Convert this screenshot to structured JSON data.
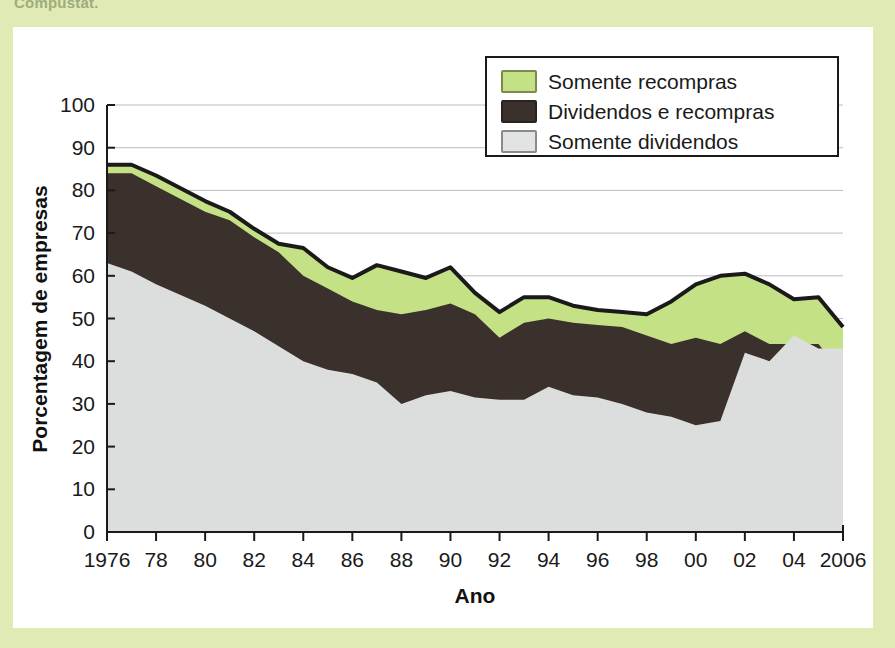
{
  "page": {
    "caption_fragment": "Compustat.",
    "background_color": "#dfeab4",
    "panel_color": "#ffffff"
  },
  "chart_data": {
    "type": "area",
    "stacked": true,
    "title": "",
    "xlabel": "Ano",
    "ylabel": "Porcentagem de empresas",
    "xlim": [
      1976,
      2006
    ],
    "ylim": [
      0,
      100
    ],
    "ytick_step": 10,
    "xtick_step": 2,
    "grid": "horizontal",
    "legend_position": "top-right",
    "y_ticks": [
      "0",
      "10",
      "20",
      "30",
      "40",
      "50",
      "60",
      "70",
      "80",
      "90",
      "100"
    ],
    "x_ticks": [
      "1976",
      "78",
      "80",
      "82",
      "84",
      "86",
      "88",
      "90",
      "92",
      "94",
      "96",
      "98",
      "00",
      "02",
      "04",
      "2006"
    ],
    "x": [
      1976,
      1977,
      1978,
      1979,
      1980,
      1981,
      1982,
      1983,
      1984,
      1985,
      1986,
      1987,
      1988,
      1989,
      1990,
      1991,
      1992,
      1993,
      1994,
      1995,
      1996,
      1997,
      1998,
      1999,
      2000,
      2001,
      2002,
      2003,
      2004,
      2005,
      2006
    ],
    "series": [
      {
        "name": "Somente dividendos",
        "color": "#dcdedd",
        "order": 1,
        "values": [
          63.0,
          61.0,
          58.0,
          55.5,
          53.0,
          50.0,
          47.0,
          43.5,
          40.0,
          38.0,
          37.0,
          35.0,
          30.0,
          32.0,
          33.0,
          31.5,
          31.0,
          31.0,
          34.0,
          32.0,
          31.5,
          30.0,
          28.0,
          27.0,
          25.0,
          26.0,
          42.0,
          40.0,
          46.0,
          43.0,
          43.0
        ]
      },
      {
        "name": "Dividendos e recompras",
        "color": "#3a302c",
        "order": 2,
        "values": [
          21.0,
          23.0,
          23.0,
          22.5,
          22.0,
          23.0,
          22.0,
          22.0,
          20.0,
          19.0,
          17.0,
          17.0,
          21.0,
          20.0,
          20.5,
          19.5,
          14.5,
          18.0,
          16.0,
          17.0,
          17.0,
          18.0,
          18.0,
          17.0,
          20.5,
          18.0,
          5.0,
          4.0,
          -2.0,
          1.0,
          -6.0
        ]
      },
      {
        "name": "Somente recompras",
        "color": "#c5e186",
        "order": 3,
        "values": [
          2.0,
          2.0,
          2.5,
          2.5,
          2.5,
          2.0,
          2.0,
          2.0,
          6.5,
          5.0,
          5.5,
          10.5,
          10.0,
          7.5,
          8.5,
          5.0,
          6.0,
          6.0,
          5.0,
          4.0,
          3.5,
          3.5,
          5.0,
          10.0,
          12.5,
          16.0,
          13.5,
          14.0,
          10.5,
          11.0,
          11.0
        ]
      }
    ],
    "cumulative_top": {
      "dividends_only": [
        63,
        61,
        58,
        55.5,
        53,
        50,
        47,
        43.5,
        40,
        38,
        37,
        35,
        30,
        32,
        33,
        31.5,
        31,
        31,
        34,
        32,
        31.5,
        30,
        28,
        27,
        25,
        26,
        42,
        40,
        46,
        43,
        43
      ],
      "div_plus_repurch": [
        84,
        84,
        81,
        78,
        75,
        73,
        69,
        65.5,
        60,
        57,
        54,
        52,
        51,
        52,
        53.5,
        51,
        45.5,
        49,
        50,
        49,
        48.5,
        48,
        46,
        44,
        45.5,
        44,
        47,
        44,
        44,
        44,
        37
      ],
      "total": [
        86,
        86,
        83.5,
        80.5,
        77.5,
        75,
        71,
        67.5,
        66.5,
        62,
        59.5,
        62.5,
        61,
        59.5,
        62,
        56,
        51.5,
        55,
        55,
        53,
        52,
        51.5,
        51,
        54,
        58,
        60,
        60.5,
        58,
        54.5,
        55,
        48
      ]
    },
    "legend": [
      {
        "label": "Somente recompras",
        "color": "#c5e186",
        "border": "#7d8a4e"
      },
      {
        "label": "Dividendos e recompras",
        "color": "#3a302c",
        "border": "#2a221f"
      },
      {
        "label": "Somente dividendos",
        "color": "#e2e4e3",
        "border": "#8a8a8a"
      }
    ]
  }
}
